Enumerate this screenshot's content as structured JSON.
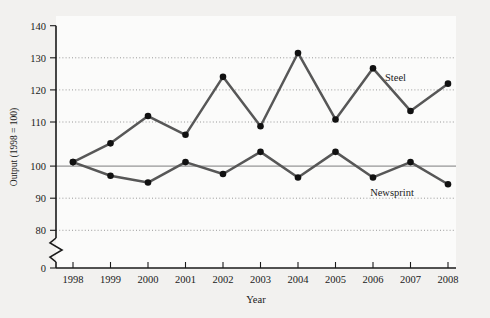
{
  "chart_data": {
    "type": "line",
    "title": "",
    "xlabel": "Year",
    "ylabel": "Output (1998 = 100)",
    "categories": [
      "1998",
      "1999",
      "2000",
      "2001",
      "2002",
      "2003",
      "2004",
      "2005",
      "2006",
      "2007",
      "2008"
    ],
    "x": [
      1998,
      1999,
      2000,
      2001,
      2002,
      2003,
      2004,
      2005,
      2006,
      2007,
      2008
    ],
    "series": [
      {
        "name": "Steel",
        "values": [
          100,
          105.5,
          113.5,
          108,
          125,
          110.5,
          132,
          112.5,
          127.5,
          115,
          123
        ]
      },
      {
        "name": "Newsprint",
        "values": [
          100,
          96,
          94,
          100,
          96.5,
          103,
          95.5,
          103,
          95.5,
          100,
          93.5
        ]
      }
    ],
    "ylim": [
      80,
      140
    ],
    "y_ticks": [
      "140",
      "130",
      "120",
      "110",
      "100",
      "90",
      "80",
      "0"
    ],
    "y_tick_values": [
      140,
      130,
      120,
      110,
      100,
      90,
      80,
      0
    ],
    "axis_break": true,
    "axis_break_note": "broken y-axis between 80 and 0",
    "reference_line": 100,
    "grid": "horizontal dotted at 130, 120, 110, 90, 80",
    "legend_position": "inline-at-series-end",
    "colors": {
      "line": "#575757",
      "marker": "#111111",
      "axis": "#1a1a1a",
      "grid": "#8d8d8d",
      "plot_background": "#fbfbfa",
      "page_background": "#f2f1ef"
    }
  },
  "labels": {
    "series_steel": "Steel",
    "series_newsprint": "Newsprint"
  }
}
